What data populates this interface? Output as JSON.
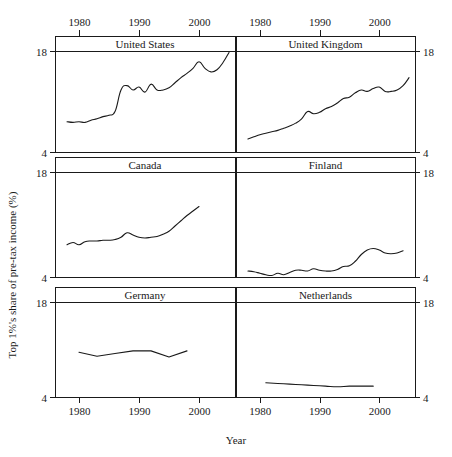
{
  "chart_data": {
    "type": "line",
    "title": "",
    "xlabel": "Year",
    "ylabel": "Top 1%'s share of pre-tax income (%)",
    "xlim": [
      1976,
      2006
    ],
    "ylim": [
      4,
      18
    ],
    "xticks": [
      1980,
      1990,
      2000
    ],
    "xtick_labels": [
      "1980",
      "1990",
      "2000"
    ],
    "yticks": [
      4,
      18
    ],
    "ytick_labels": [
      "4",
      "18"
    ],
    "grid": false,
    "legend": "none",
    "layout": "facet grid 3 rows x 2 columns, strip labels on top of each panel",
    "panels": [
      {
        "name": "United States",
        "row": 0,
        "col": 0,
        "x": [
          1978,
          1979,
          1980,
          1981,
          1982,
          1983,
          1984,
          1985,
          1986,
          1987,
          1988,
          1989,
          1990,
          1991,
          1992,
          1993,
          1994,
          1995,
          1996,
          1997,
          1998,
          1999,
          2000,
          2001,
          2002,
          2003,
          2004,
          2005
        ],
        "y": [
          8.2,
          8.1,
          8.2,
          8.1,
          8.4,
          8.6,
          8.9,
          9.1,
          9.6,
          12.6,
          13.2,
          12.6,
          13.0,
          12.3,
          13.4,
          12.6,
          12.6,
          12.9,
          13.6,
          14.3,
          14.9,
          15.6,
          16.5,
          15.6,
          15.1,
          15.4,
          16.4,
          17.8
        ],
        "y_start": 8.2,
        "y_end": 17.8
      },
      {
        "name": "United Kingdom",
        "row": 0,
        "col": 1,
        "x": [
          1978,
          1979,
          1980,
          1981,
          1982,
          1983,
          1984,
          1985,
          1986,
          1987,
          1988,
          1989,
          1990,
          1991,
          1992,
          1993,
          1994,
          1995,
          1996,
          1997,
          1998,
          1999,
          2000,
          2001,
          2002,
          2003,
          2004,
          2005
        ],
        "y": [
          5.8,
          6.1,
          6.4,
          6.6,
          6.8,
          7.0,
          7.3,
          7.6,
          8.0,
          8.6,
          9.6,
          9.3,
          9.5,
          10.0,
          10.3,
          10.8,
          11.4,
          11.6,
          12.2,
          12.6,
          12.4,
          12.8,
          13.0,
          12.4,
          12.4,
          12.6,
          13.2,
          14.3
        ],
        "y_start": 5.8,
        "y_end": 14.3
      },
      {
        "name": "Canada",
        "row": 1,
        "col": 0,
        "x": [
          1978,
          1979,
          1980,
          1981,
          1982,
          1983,
          1984,
          1985,
          1986,
          1987,
          1988,
          1989,
          1990,
          1991,
          1992,
          1993,
          1994,
          1995,
          1996,
          1997,
          1998,
          1999,
          2000
        ],
        "y": [
          8.3,
          8.6,
          8.3,
          8.7,
          8.8,
          8.8,
          8.9,
          8.9,
          9.0,
          9.3,
          9.9,
          9.6,
          9.3,
          9.2,
          9.3,
          9.4,
          9.7,
          10.1,
          10.8,
          11.5,
          12.2,
          12.8,
          13.4
        ],
        "y_start": 8.3,
        "y_end": 13.4
      },
      {
        "name": "Finland",
        "row": 1,
        "col": 1,
        "x": [
          1978,
          1979,
          1980,
          1981,
          1982,
          1983,
          1984,
          1985,
          1986,
          1987,
          1988,
          1989,
          1990,
          1991,
          1992,
          1993,
          1994,
          1995,
          1996,
          1997,
          1998,
          1999,
          2000,
          2001,
          2002,
          2003,
          2004
        ],
        "y": [
          4.8,
          4.7,
          4.5,
          4.3,
          4.2,
          4.5,
          4.3,
          4.6,
          4.9,
          4.9,
          4.8,
          5.1,
          4.9,
          4.8,
          4.8,
          5.0,
          5.4,
          5.5,
          6.1,
          7.0,
          7.6,
          7.8,
          7.6,
          7.2,
          7.1,
          7.2,
          7.5
        ],
        "y_start": 4.8,
        "y_end": 7.5
      },
      {
        "name": "Germany",
        "row": 2,
        "col": 0,
        "x": [
          1980,
          1983,
          1986,
          1989,
          1992,
          1995,
          1998
        ],
        "y": [
          10.6,
          10.0,
          10.4,
          10.8,
          10.8,
          9.9,
          10.8
        ],
        "y_start": 10.6,
        "y_end": 10.8
      },
      {
        "name": "Netherlands",
        "row": 2,
        "col": 1,
        "x": [
          1981,
          1983,
          1985,
          1987,
          1989,
          1991,
          1993,
          1995,
          1997,
          1999
        ],
        "y": [
          6.1,
          6.0,
          5.9,
          5.8,
          5.7,
          5.6,
          5.5,
          5.6,
          5.6,
          5.6
        ],
        "y_start": 6.1,
        "y_end": 5.6
      }
    ]
  },
  "axes": {
    "ylabel": "Top 1%'s share of pre-tax income (%)",
    "xlabel": "Year",
    "left_ticks": [
      "18",
      "4",
      "18",
      "4",
      "18",
      "4"
    ],
    "right_ticks": [
      "18",
      "4",
      "18",
      "4",
      "18",
      "4"
    ],
    "top_xtick_labels": [
      "1980",
      "1990",
      "2000",
      "1980",
      "1990",
      "2000"
    ],
    "bottom_xtick_labels": [
      "1980",
      "1990",
      "2000",
      "1980",
      "1990",
      "2000"
    ]
  },
  "strips": [
    "United States",
    "United Kingdom",
    "Canada",
    "Finland",
    "Germany",
    "Netherlands"
  ],
  "colors": {
    "line": "#1a1a1a",
    "frame": "#1a1a1a",
    "background": "#ffffff"
  }
}
